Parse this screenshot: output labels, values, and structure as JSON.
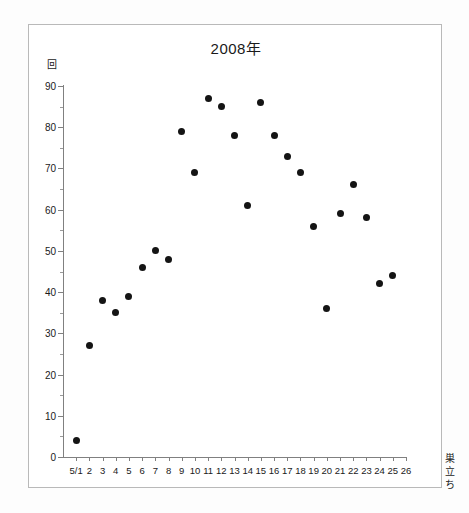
{
  "figure": {
    "title": "2008年",
    "y_axis_unit": "回",
    "annotation": {
      "text": "巣立ち",
      "chars": [
        "巣",
        "立",
        "ち"
      ]
    },
    "point_color": "#141414",
    "axis_color": "#808080",
    "frame_color": "#b9b9b9"
  },
  "chart_data": {
    "type": "scatter",
    "title": "2008年",
    "xlabel": "",
    "ylabel": "回",
    "xlim": [
      0,
      26
    ],
    "ylim": [
      0,
      90
    ],
    "grid": false,
    "legend": null,
    "y_ticks": [
      0,
      10,
      20,
      30,
      40,
      50,
      60,
      70,
      80,
      90
    ],
    "y_tick_labels": [
      "0",
      "10",
      "20",
      "30",
      "40",
      "50",
      "60",
      "70",
      "80",
      "90"
    ],
    "y_minor_ticks": [
      5,
      15,
      25,
      35,
      45,
      55,
      65,
      75,
      85
    ],
    "x_ticks": [
      1,
      2,
      3,
      4,
      5,
      6,
      7,
      8,
      9,
      10,
      11,
      12,
      13,
      14,
      15,
      16,
      17,
      18,
      19,
      20,
      21,
      22,
      23,
      24,
      25,
      26
    ],
    "x_tick_labels": [
      "5/1",
      "2",
      "3",
      "4",
      "5",
      "6",
      "7",
      "8",
      "9",
      "10",
      "11",
      "12",
      "13",
      "14",
      "15",
      "16",
      "17",
      "18",
      "19",
      "20",
      "21",
      "22",
      "23",
      "24",
      "25",
      "26"
    ],
    "annotations": [
      {
        "text": "巣立ち",
        "x": 24.5,
        "y": 12
      }
    ],
    "x": [
      1,
      2,
      3,
      4,
      5,
      6,
      7,
      8,
      9,
      10,
      11,
      12,
      13,
      14,
      15,
      16,
      17,
      18,
      19,
      20,
      21,
      22,
      23,
      24,
      25
    ],
    "values": [
      4,
      27,
      38,
      35,
      39,
      46,
      50,
      48,
      79,
      69,
      87,
      85,
      78,
      61,
      86,
      78,
      73,
      69,
      56,
      36,
      59,
      66,
      58,
      42,
      44
    ],
    "points": [
      {
        "x": 1,
        "x_label": "5/1",
        "y": 4
      },
      {
        "x": 2,
        "x_label": "2",
        "y": 27
      },
      {
        "x": 3,
        "x_label": "3",
        "y": 38
      },
      {
        "x": 4,
        "x_label": "4",
        "y": 35
      },
      {
        "x": 5,
        "x_label": "5",
        "y": 39
      },
      {
        "x": 6,
        "x_label": "6",
        "y": 46
      },
      {
        "x": 7,
        "x_label": "7",
        "y": 50
      },
      {
        "x": 8,
        "x_label": "8",
        "y": 48
      },
      {
        "x": 9,
        "x_label": "9",
        "y": 79
      },
      {
        "x": 10,
        "x_label": "10",
        "y": 69
      },
      {
        "x": 11,
        "x_label": "11",
        "y": 87
      },
      {
        "x": 12,
        "x_label": "12",
        "y": 85
      },
      {
        "x": 13,
        "x_label": "13",
        "y": 78
      },
      {
        "x": 14,
        "x_label": "14",
        "y": 61
      },
      {
        "x": 15,
        "x_label": "15",
        "y": 86
      },
      {
        "x": 16,
        "x_label": "16",
        "y": 78
      },
      {
        "x": 17,
        "x_label": "17",
        "y": 73
      },
      {
        "x": 18,
        "x_label": "18",
        "y": 69
      },
      {
        "x": 19,
        "x_label": "19",
        "y": 56
      },
      {
        "x": 20,
        "x_label": "20",
        "y": 36
      },
      {
        "x": 21,
        "x_label": "21",
        "y": 59
      },
      {
        "x": 22,
        "x_label": "22",
        "y": 66
      },
      {
        "x": 23,
        "x_label": "23",
        "y": 58
      },
      {
        "x": 24,
        "x_label": "24",
        "y": 42
      },
      {
        "x": 25,
        "x_label": "25",
        "y": 44
      }
    ]
  }
}
